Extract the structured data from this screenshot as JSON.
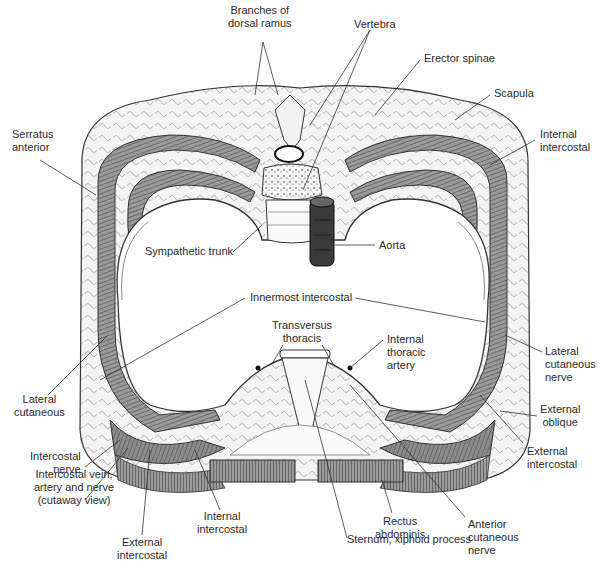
{
  "figure": {
    "colors": {
      "muscle": "#8a8a8a",
      "muscle_dark": "#5a5a5a",
      "aorta": "#3a3a3a",
      "outline": "#333333",
      "background": "#ffffff"
    }
  },
  "labels": {
    "branches_dorsal_ramus": [
      "Branches of",
      "dorsal ramus"
    ],
    "vertebra": [
      "Vertebra"
    ],
    "erector_spinae": [
      "Erector spinae"
    ],
    "scapula": [
      "Scapula"
    ],
    "serratus_anterior": [
      "Serratus",
      "anterior"
    ],
    "internal_intercostal_top": [
      "Internal",
      "intercostal"
    ],
    "sympathetic_trunk": [
      "Sympathetic trunk"
    ],
    "aorta": [
      "Aorta"
    ],
    "innermost_intercostal": [
      "Innermost intercostal"
    ],
    "transversus_thoracis": [
      "Transversus",
      "thoracis"
    ],
    "internal_thoracic_artery": [
      "Internal",
      "thoracic",
      "artery"
    ],
    "lateral_cutaneous_left": [
      "Lateral",
      "cutaneous"
    ],
    "lateral_cutaneous_nerve": [
      "Lateral",
      "cutaneous",
      "nerve"
    ],
    "external_oblique": [
      "External",
      "oblique"
    ],
    "external_intercostal_right": [
      "External",
      "intercostal"
    ],
    "intercostal_nerve": [
      "Intercostal",
      "nerve"
    ],
    "intercostal_vein_artery_nerve": [
      "Intercostal vein,",
      "artery and nerve",
      "(cutaway view)"
    ],
    "internal_intercostal_bottom": [
      "Internal",
      "intercostal"
    ],
    "external_intercostal_left": [
      "External",
      "intercostal"
    ],
    "rectus_abdominis": [
      "Rectus",
      "abdominis"
    ],
    "anterior_cutaneous_nerve": [
      "Anterior",
      "cutaneous",
      "nerve"
    ],
    "sternum_xiphoid": [
      "Sternum, xiphoid process"
    ]
  }
}
